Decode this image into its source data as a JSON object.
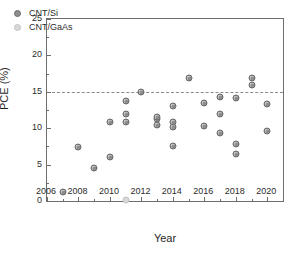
{
  "chart_data": {
    "type": "scatter",
    "title": "",
    "xlabel": "Year",
    "ylabel": "PCE (%)",
    "xlim": [
      2006,
      2021
    ],
    "ylim": [
      0,
      25
    ],
    "xticks": [
      2006,
      2008,
      2010,
      2012,
      2014,
      2016,
      2018,
      2020
    ],
    "xticklabels": [
      "2006",
      "2008",
      "2010",
      "2012",
      "2014",
      "2016",
      "2018",
      "2020"
    ],
    "xminorticks": [
      2007,
      2009,
      2011,
      2013,
      2015,
      2017,
      2019,
      2021
    ],
    "yticks": [
      0,
      5,
      10,
      15,
      20,
      25
    ],
    "yticklabels": [
      "0",
      "5",
      "10",
      "15",
      "20",
      "25"
    ],
    "yminorticks": [
      2.5,
      7.5,
      12.5,
      17.5,
      22.5
    ],
    "grid": false,
    "legend_position": "upper left",
    "annotations": [
      {
        "type": "hline",
        "y": 15,
        "style": "dashed",
        "color": "#8a8a8a"
      }
    ],
    "series": [
      {
        "name": "CNT/Si",
        "color": "#8d8d8d",
        "marker": "circle",
        "points": [
          {
            "x": 2007,
            "y": 1.3
          },
          {
            "x": 2008,
            "y": 7.4
          },
          {
            "x": 2009,
            "y": 4.5
          },
          {
            "x": 2010,
            "y": 6.0
          },
          {
            "x": 2010,
            "y": 10.8
          },
          {
            "x": 2011,
            "y": 10.8
          },
          {
            "x": 2011,
            "y": 11.9
          },
          {
            "x": 2011,
            "y": 13.8
          },
          {
            "x": 2012,
            "y": 15.0
          },
          {
            "x": 2013,
            "y": 10.5
          },
          {
            "x": 2013,
            "y": 11.2
          },
          {
            "x": 2013,
            "y": 11.5
          },
          {
            "x": 2014,
            "y": 7.5
          },
          {
            "x": 2014,
            "y": 10.2
          },
          {
            "x": 2014,
            "y": 10.8
          },
          {
            "x": 2014,
            "y": 13.0
          },
          {
            "x": 2015,
            "y": 16.9
          },
          {
            "x": 2016,
            "y": 10.3
          },
          {
            "x": 2016,
            "y": 13.4
          },
          {
            "x": 2017,
            "y": 9.3
          },
          {
            "x": 2017,
            "y": 11.9
          },
          {
            "x": 2017,
            "y": 14.3
          },
          {
            "x": 2018,
            "y": 6.4
          },
          {
            "x": 2018,
            "y": 7.8
          },
          {
            "x": 2018,
            "y": 14.1
          },
          {
            "x": 2019,
            "y": 16.0
          },
          {
            "x": 2019,
            "y": 16.9
          },
          {
            "x": 2020,
            "y": 9.6
          },
          {
            "x": 2020,
            "y": 13.3
          }
        ]
      },
      {
        "name": "CNT/GaAs",
        "color": "#d8d8d8",
        "marker": "circle",
        "points": [
          {
            "x": 2011,
            "y": 0.2
          }
        ]
      }
    ]
  },
  "legend": {
    "items": [
      {
        "label": "CNT/Si",
        "series": "si"
      },
      {
        "label": "CNT/GaAs",
        "series": "gaas"
      }
    ]
  }
}
